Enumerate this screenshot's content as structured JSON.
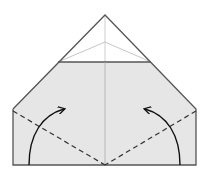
{
  "diagram": {
    "type": "origami-fold-step",
    "colors": {
      "paper_fill": "#e6e6e6",
      "outline": "#555555",
      "crease": "#b0b0b0",
      "dashed_fold": "#333333",
      "arrow": "#111111",
      "background": "#ffffff"
    },
    "elements": [
      {
        "name": "top-flap-triangle",
        "kind": "outline"
      },
      {
        "name": "paper-body",
        "kind": "shaded-shape"
      },
      {
        "name": "center-crease",
        "kind": "crease"
      },
      {
        "name": "left-valley-fold-line",
        "kind": "dashed-line"
      },
      {
        "name": "right-valley-fold-line",
        "kind": "dashed-line"
      },
      {
        "name": "left-fold-arrow",
        "kind": "arrow",
        "direction": "up-right"
      },
      {
        "name": "right-fold-arrow",
        "kind": "arrow",
        "direction": "up-left"
      }
    ]
  }
}
